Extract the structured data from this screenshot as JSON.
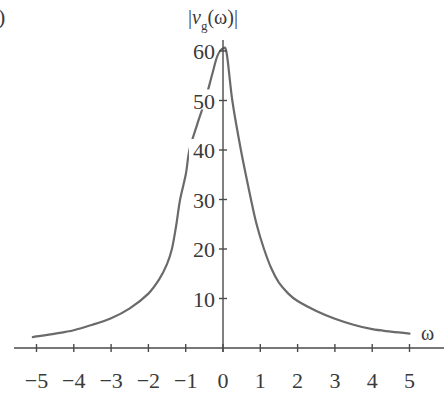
{
  "panel_label": ")",
  "chart_data": {
    "type": "line",
    "title": "",
    "xlabel": "ω",
    "ylabel": "|v_g(ω)|",
    "ylabel_parts": {
      "prefix": "|",
      "var": "v",
      "sub": "g",
      "suffix": "(ω)|"
    },
    "xlim": [
      -5.5,
      5.8
    ],
    "ylim": [
      0,
      62
    ],
    "grid": false,
    "legend": null,
    "x_ticks": [
      -5,
      -4,
      -3,
      -2,
      -1,
      0,
      1,
      2,
      3,
      4,
      5
    ],
    "x_tick_labels": [
      "−5",
      "−4",
      "−3",
      "−2",
      "−1",
      "0",
      "1",
      "2",
      "3",
      "4",
      "5"
    ],
    "y_ticks": [
      10,
      20,
      30,
      40,
      50,
      60
    ],
    "y_tick_labels": [
      "10",
      "20",
      "30",
      "40",
      "50",
      "60"
    ],
    "series": [
      {
        "name": "|v_g(ω)|",
        "color": "#6a6a6a",
        "x": [
          -5.1,
          -4.5,
          -4,
          -3.5,
          -3,
          -2.5,
          -2,
          -1.7,
          -1.5,
          -1.37,
          -1.25,
          -1.15,
          -1.0,
          -0.9,
          -0.7,
          -0.48,
          -0.3,
          -0.15,
          0,
          0.1,
          0.25,
          0.48,
          0.75,
          0.9,
          1.1,
          1.3,
          1.5,
          1.75,
          2,
          2.5,
          3,
          3.5,
          4,
          4.5,
          5
        ],
        "y": [
          2.2,
          2.9,
          3.6,
          4.7,
          6.0,
          8.0,
          11.0,
          14.0,
          17.0,
          20.0,
          25.0,
          30.0,
          35.0,
          40.0,
          45.0,
          50.0,
          55.0,
          59.0,
          60.5,
          59.5,
          50.0,
          40.0,
          30.0,
          25.0,
          20.0,
          16.0,
          13.2,
          11.0,
          9.5,
          7.5,
          5.9,
          4.7,
          3.8,
          3.3,
          2.9
        ]
      }
    ]
  }
}
